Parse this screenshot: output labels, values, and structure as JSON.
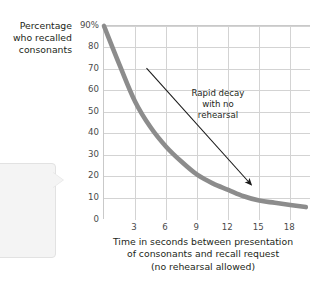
{
  "chart_data": {
    "type": "line",
    "title": "",
    "subtitle": "",
    "xlabel_lines": [
      "Time in seconds between presentation",
      "of consonants and recall request",
      "(no rehearsal allowed)"
    ],
    "ylabel_lines": [
      "Percentage",
      "who recalled",
      "consonants"
    ],
    "x": [
      0,
      1.5,
      3,
      4.5,
      6,
      7.5,
      9,
      10.5,
      12,
      13.5,
      15,
      16.5,
      18,
      19.5
    ],
    "y": [
      90,
      72,
      55,
      43,
      34,
      27,
      21,
      17,
      14,
      11,
      9,
      8,
      7,
      6
    ],
    "xlim": [
      0,
      20
    ],
    "ylim": [
      0,
      90
    ],
    "xticks": [
      3,
      6,
      9,
      12,
      15,
      18
    ],
    "xticklabels": [
      "3",
      "6",
      "9",
      "12",
      "15",
      "18"
    ],
    "yticks": [
      0,
      10,
      20,
      30,
      40,
      50,
      60,
      70,
      80,
      90
    ],
    "yticklabels": [
      "0",
      "10",
      "20",
      "30",
      "40",
      "50",
      "60",
      "70",
      "80",
      "90%"
    ],
    "grid": true,
    "legend": "none",
    "series_color": "#8c8c8c",
    "grid_color": "#d3d3d3",
    "axis_color": "#c9c9c9",
    "annotations": [
      {
        "name": "rapid-decay-note",
        "lines": [
          "Rapid decay",
          "with no",
          "rehearsal"
        ],
        "arrow_from": [
          4.2,
          70
        ],
        "arrow_to": [
          14.3,
          16
        ]
      }
    ]
  },
  "callout": {
    "lines": [
      "ecay",
      "ormation",
      "rom",
      "see also"
    ],
    "background": "#f4f4f4"
  },
  "colors": {
    "page_background": "#ffffff",
    "text": "#231f20",
    "tick_text": "#4a4a4a",
    "curve": "#8c8c8c",
    "grid": "#d3d3d3"
  }
}
